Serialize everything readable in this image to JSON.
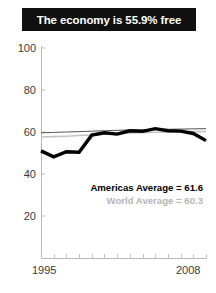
{
  "title": {
    "text": "The economy is 55.9% free"
  },
  "legend": {
    "americas": "Americas Average = 61.6",
    "world": "World Average = 60.3"
  },
  "chart_data": {
    "type": "line",
    "title": "The economy is 55.9% free",
    "xlabel": "",
    "ylabel": "",
    "xlim": [
      1995,
      2008
    ],
    "ylim": [
      0,
      100
    ],
    "yticks": [
      100,
      80,
      60,
      40,
      20
    ],
    "xticks": [
      1995,
      1996,
      1997,
      1998,
      1999,
      2000,
      2001,
      2002,
      2003,
      2004,
      2005,
      2006,
      2007,
      2008
    ],
    "xtick_labels_shown": [
      "1995",
      "2008"
    ],
    "grid": false,
    "legend_position": "inside-lower-right",
    "x": [
      1995,
      1996,
      1997,
      1998,
      1999,
      2000,
      2001,
      2002,
      2003,
      2004,
      2005,
      2006,
      2007,
      2008
    ],
    "series": [
      {
        "name": "Country economic freedom",
        "color": "#000000",
        "width": 3.4,
        "values": [
          51.0,
          48.2,
          50.6,
          50.4,
          58.5,
          59.6,
          59.0,
          60.6,
          60.3,
          61.6,
          60.6,
          60.4,
          59.3,
          55.9
        ]
      },
      {
        "name": "Americas Average",
        "color": "#555555",
        "width": 1.0,
        "values": [
          59.6,
          59.8,
          60.0,
          60.2,
          60.4,
          60.6,
          60.8,
          61.0,
          61.1,
          61.2,
          61.3,
          61.4,
          61.5,
          61.6
        ]
      },
      {
        "name": "World Average",
        "color": "#c4c4c4",
        "width": 1.6,
        "values": [
          57.6,
          57.8,
          58.0,
          58.3,
          58.6,
          58.9,
          59.2,
          59.5,
          59.7,
          59.9,
          60.0,
          60.1,
          60.2,
          60.3
        ]
      }
    ]
  }
}
